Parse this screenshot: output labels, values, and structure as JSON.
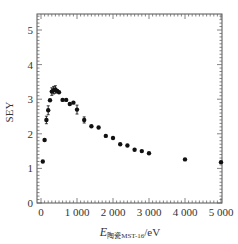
{
  "chart_data": {
    "type": "scatter",
    "title": "",
    "xlabel": "E",
    "xlabel_subscript": "陶瓷MST-16",
    "xlabel_unit": "/eV",
    "ylabel": "SEY",
    "xlim": [
      0,
      5000
    ],
    "ylim": [
      0,
      5.5
    ],
    "xticks": [
      0,
      1000,
      2000,
      3000,
      4000,
      5000
    ],
    "xtick_labels": [
      "0",
      "1 000",
      "2 000",
      "3 000",
      "4 000",
      "5 000"
    ],
    "yticks": [
      0,
      1,
      2,
      3,
      4,
      5
    ],
    "ytick_labels": [
      "0",
      "1",
      "2",
      "3",
      "4",
      "5"
    ],
    "grid": false,
    "legend": null,
    "series": [
      {
        "name": "SEY",
        "color": "#111111",
        "marker": "circle",
        "points": [
          {
            "x": 50,
            "y": 1.2,
            "err": 0
          },
          {
            "x": 100,
            "y": 1.82,
            "err": 0
          },
          {
            "x": 150,
            "y": 2.4,
            "err": 0.08
          },
          {
            "x": 200,
            "y": 2.68,
            "err": 0.1
          },
          {
            "x": 250,
            "y": 2.97,
            "err": 0
          },
          {
            "x": 300,
            "y": 3.22,
            "err": 0.08
          },
          {
            "x": 350,
            "y": 3.26,
            "err": 0.08
          },
          {
            "x": 400,
            "y": 3.28,
            "err": 0.08
          },
          {
            "x": 450,
            "y": 3.24,
            "err": 0
          },
          {
            "x": 500,
            "y": 3.2,
            "err": 0
          },
          {
            "x": 600,
            "y": 2.98,
            "err": 0
          },
          {
            "x": 700,
            "y": 2.98,
            "err": 0
          },
          {
            "x": 800,
            "y": 2.86,
            "err": 0
          },
          {
            "x": 900,
            "y": 2.9,
            "err": 0
          },
          {
            "x": 1000,
            "y": 2.7,
            "err": 0.1
          },
          {
            "x": 1200,
            "y": 2.4,
            "err": 0.06
          },
          {
            "x": 1400,
            "y": 2.22,
            "err": 0
          },
          {
            "x": 1600,
            "y": 2.18,
            "err": 0
          },
          {
            "x": 1800,
            "y": 1.94,
            "err": 0
          },
          {
            "x": 2000,
            "y": 1.88,
            "err": 0
          },
          {
            "x": 2200,
            "y": 1.7,
            "err": 0
          },
          {
            "x": 2400,
            "y": 1.66,
            "err": 0
          },
          {
            "x": 2600,
            "y": 1.54,
            "err": 0
          },
          {
            "x": 2800,
            "y": 1.5,
            "err": 0
          },
          {
            "x": 3000,
            "y": 1.44,
            "err": 0
          },
          {
            "x": 4000,
            "y": 1.26,
            "err": 0
          },
          {
            "x": 5000,
            "y": 1.18,
            "err": 0
          }
        ]
      }
    ]
  },
  "layout": {
    "plot_left": 37,
    "plot_right": 222,
    "plot_top": 14,
    "plot_bottom": 203,
    "x0_px": 41,
    "x_per_1000": 36,
    "y_per_unit": 34.6
  }
}
